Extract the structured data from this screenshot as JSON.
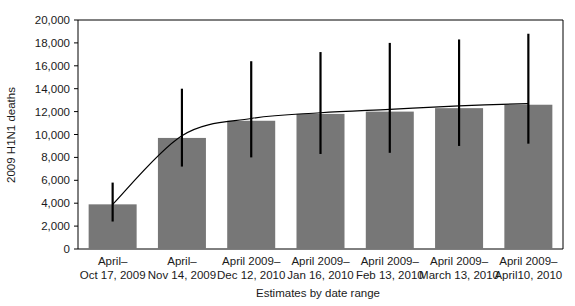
{
  "chart_data": {
    "type": "bar",
    "title": "",
    "xlabel": "Estimates by date range",
    "ylabel": "2009 H1N1 deaths",
    "ylim": [
      0,
      20000
    ],
    "ytick_values": [
      0,
      2000,
      4000,
      6000,
      8000,
      10000,
      12000,
      14000,
      16000,
      18000,
      20000
    ],
    "ytick_labels": [
      "0",
      "2,000",
      "4,000",
      "6,000",
      "8,000",
      "10,000",
      "12,000",
      "14,000",
      "16,000",
      "18,000",
      "20,000"
    ],
    "grid": false,
    "legend": "none",
    "bar_color": "#777777",
    "error_bar_color": "#000000",
    "trend_line_color": "#000000",
    "categories": [
      {
        "line1": "April–",
        "line2": "Oct 17, 2009"
      },
      {
        "line1": "April–",
        "line2": "Nov 14, 2009"
      },
      {
        "line1": "April 2009–",
        "line2": "Dec 12, 2010"
      },
      {
        "line1": "April 2009–",
        "line2": "Jan 16, 2010"
      },
      {
        "line1": "April 2009–",
        "line2": "Feb 13, 2010"
      },
      {
        "line1": "April 2009–",
        "line2": "March 13, 2010"
      },
      {
        "line1": "April 2009–",
        "line2": "April10, 2010"
      }
    ],
    "values": [
      3900,
      9700,
      11200,
      11800,
      12000,
      12300,
      12600
    ],
    "error_low": [
      2400,
      7200,
      8000,
      8300,
      8400,
      9000,
      9200
    ],
    "error_high": [
      5800,
      14000,
      16400,
      17200,
      18000,
      18300,
      18800
    ],
    "trend_line_values": [
      3900,
      9900,
      11400,
      11900,
      12200,
      12500,
      12700
    ]
  }
}
